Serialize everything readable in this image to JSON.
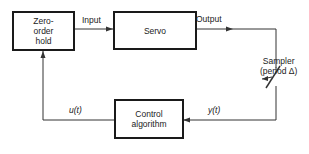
{
  "diagram": {
    "blocks": {
      "zoh": {
        "lines": [
          "Zero-",
          "order",
          "hold"
        ]
      },
      "servo": {
        "label": "Servo"
      },
      "control": {
        "lines": [
          "Control",
          "algorithm"
        ]
      }
    },
    "signals": {
      "input": "Input",
      "output": "Output",
      "u": "u(t)",
      "y": "y(t)"
    },
    "sampler": {
      "lines": [
        "Sampler",
        "(period Δ)"
      ]
    }
  }
}
